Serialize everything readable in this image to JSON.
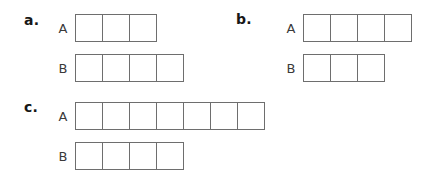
{
  "figure": {
    "type": "tape-diagram-worksheet",
    "background_color": "#ffffff",
    "cell_border_color": "#6e6e6e",
    "cell_fill_color": "#ffffff",
    "label_color": "#171717",
    "row_label_color": "#3a3a3a",
    "panels": [
      {
        "id": "a",
        "label": "a.",
        "rows": [
          {
            "label": "A",
            "units": 3
          },
          {
            "label": "B",
            "units": 4
          }
        ]
      },
      {
        "id": "b",
        "label": "b.",
        "rows": [
          {
            "label": "A",
            "units": 4
          },
          {
            "label": "B",
            "units": 3
          }
        ]
      },
      {
        "id": "c",
        "label": "c.",
        "rows": [
          {
            "label": "A",
            "units": 7
          },
          {
            "label": "B",
            "units": 4
          }
        ]
      }
    ]
  },
  "chart_data": {
    "type": "bar",
    "title": "",
    "subtitle": "",
    "xlabel": "",
    "ylabel": "",
    "grid": false,
    "legend": "none",
    "unit_size_px": 28,
    "panels": [
      {
        "name": "a",
        "categories": [
          "A",
          "B"
        ],
        "values": [
          3,
          4
        ]
      },
      {
        "name": "b",
        "categories": [
          "A",
          "B"
        ],
        "values": [
          4,
          3
        ]
      },
      {
        "name": "c",
        "categories": [
          "A",
          "B"
        ],
        "values": [
          7,
          4
        ]
      }
    ]
  }
}
